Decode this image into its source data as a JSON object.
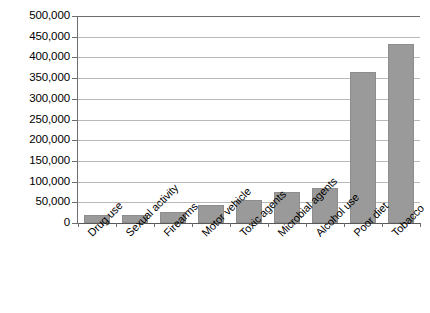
{
  "chart_data": {
    "type": "bar",
    "title": "",
    "xlabel": "",
    "ylabel": "",
    "ylim": [
      0,
      500000
    ],
    "grid": true,
    "legend": "none",
    "bar_color": "#9a9a9a",
    "gridline_color": "#b9b9b9",
    "axis_color": "#6e6e6e",
    "categories": [
      "Drug use",
      "Sexual activity",
      "Firearms",
      "Motor vehicle",
      "Toxic agents",
      "Microbial agents",
      "Alcohol use",
      "Poor diet",
      "Tobacco"
    ],
    "values": [
      20000,
      20000,
      27000,
      43000,
      55000,
      75000,
      85000,
      365000,
      432000
    ],
    "ytick_labels": [
      "500,000",
      "450,000",
      "400,000",
      "350,000",
      "300,000",
      "250,000",
      "200,000",
      "150,000",
      "100,000",
      "50,000",
      "0"
    ],
    "ytick_values": [
      500000,
      450000,
      400000,
      350000,
      300000,
      250000,
      200000,
      150000,
      100000,
      50000,
      0
    ]
  }
}
